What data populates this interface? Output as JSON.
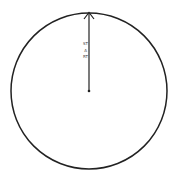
{
  "diagram": {
    "type": "circle-with-radius-arrow",
    "circle": {
      "cx": 89,
      "cy": 91,
      "r": 78,
      "stroke": "#222222",
      "stroke_width": 1.5
    },
    "arrow": {
      "x1": 89,
      "y1": 91,
      "x2": 89,
      "y2": 13,
      "stroke": "#222222",
      "direction": "up"
    },
    "center_dot": {
      "cx": 89,
      "cy": 91
    },
    "label": "START"
  }
}
